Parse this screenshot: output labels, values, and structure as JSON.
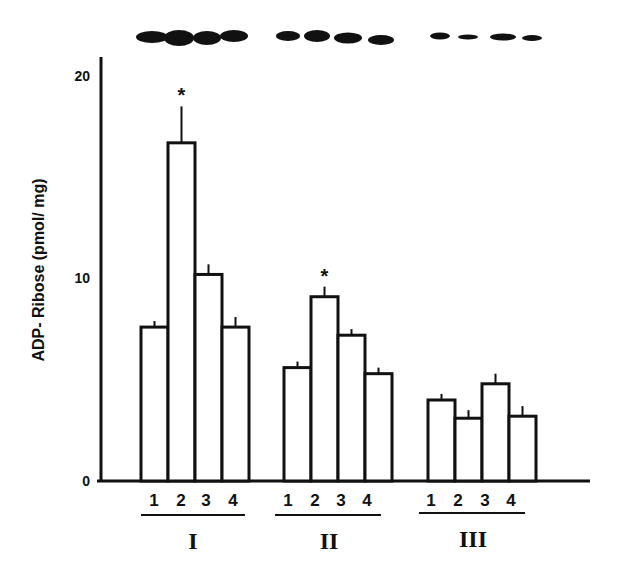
{
  "chart_data": {
    "type": "bar",
    "title": "",
    "xlabel": "",
    "ylabel": "ADP- Ribose (pmol/ mg)",
    "ylim": [
      0,
      20
    ],
    "yticks": [
      "0",
      "10",
      "20"
    ],
    "grid": false,
    "legend": null,
    "groups": [
      "I",
      "II",
      "III"
    ],
    "categories": [
      "1",
      "2",
      "3",
      "4"
    ],
    "series": [
      {
        "name": "I",
        "values": [
          7.6,
          16.7,
          10.2,
          7.6
        ],
        "errors": [
          0.3,
          1.8,
          0.5,
          0.5
        ],
        "significant": [
          false,
          true,
          false,
          false
        ]
      },
      {
        "name": "II",
        "values": [
          5.6,
          9.1,
          7.2,
          5.3
        ],
        "errors": [
          0.3,
          0.5,
          0.3,
          0.3
        ],
        "significant": [
          false,
          true,
          false,
          false
        ]
      },
      {
        "name": "III",
        "values": [
          4.0,
          3.1,
          4.8,
          3.2
        ],
        "errors": [
          0.3,
          0.4,
          0.5,
          0.5
        ],
        "significant": [
          false,
          false,
          false,
          false
        ]
      }
    ],
    "annotations": [
      "*",
      "*"
    ],
    "blot": {
      "description": "Western blot bands above each bar",
      "bands": [
        {
          "group": "I",
          "intensity": [
            0.85,
            1.0,
            0.95,
            0.8
          ]
        },
        {
          "group": "II",
          "intensity": [
            0.6,
            0.75,
            0.65,
            0.6
          ]
        },
        {
          "group": "III",
          "intensity": [
            0.4,
            0.3,
            0.45,
            0.35
          ]
        }
      ]
    }
  },
  "axis": {
    "y_title": "ADP- Ribose (pmol/ mg)",
    "ticks": {
      "t0": "0",
      "t10": "10",
      "t20": "20"
    }
  },
  "labels": {
    "g1": {
      "c1": "1",
      "c2": "2",
      "c3": "3",
      "c4": "4",
      "name": "I"
    },
    "g2": {
      "c1": "1",
      "c2": "2",
      "c3": "3",
      "c4": "4",
      "name": "II"
    },
    "g3": {
      "c1": "1",
      "c2": "2",
      "c3": "3",
      "c4": "4",
      "name": "III"
    },
    "star": "*"
  },
  "colors": {
    "ink": "#111111",
    "bar_fill": "#ffffff",
    "background": "#ffffff"
  }
}
